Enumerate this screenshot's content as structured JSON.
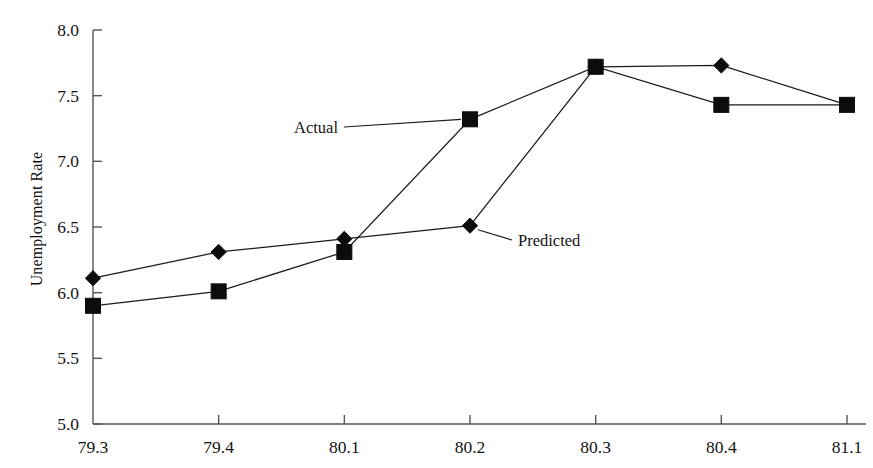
{
  "chart_data": {
    "type": "line",
    "title": "",
    "subtitle": "",
    "xlabel": "",
    "ylabel": "Unemployment Rate",
    "x": [
      "79.3",
      "79.4",
      "80.1",
      "80.2",
      "80.3",
      "80.4",
      "81.1"
    ],
    "categories": [
      "79.3",
      "79.4",
      "80.1",
      "80.2",
      "80.3",
      "80.4",
      "81.1"
    ],
    "xtick_labels": [
      "79.3",
      "79.4",
      "80.1",
      "80.2",
      "80.3",
      "80.4",
      "81.1"
    ],
    "ytick_labels": [
      "5.0",
      "5.5",
      "6.0",
      "6.5",
      "7.0",
      "7.5",
      "8.0"
    ],
    "ytick_values": [
      5.0,
      5.5,
      6.0,
      6.5,
      7.0,
      7.5,
      8.0
    ],
    "ylim": [
      5.0,
      8.0
    ],
    "grid": false,
    "legend_position": "inline-annotations",
    "series": [
      {
        "name": "Actual",
        "marker": "square",
        "color": "#0c0c0c",
        "values": [
          5.9,
          6.01,
          6.31,
          7.32,
          7.72,
          7.43,
          7.43
        ]
      },
      {
        "name": "Predicted",
        "marker": "diamond",
        "color": "#0c0c0c",
        "values": [
          6.11,
          6.31,
          6.41,
          6.51,
          7.72,
          7.73,
          7.43
        ]
      }
    ],
    "annotations": [
      {
        "text": "Actual",
        "points_to_series": "Actual",
        "points_to_x": "80.2"
      },
      {
        "text": "Predicted",
        "points_to_series": "Predicted",
        "points_to_x": "80.2"
      }
    ]
  },
  "colors": {
    "background": "#ffffff",
    "ink": "#0c0c0c",
    "axis": "#555555"
  }
}
